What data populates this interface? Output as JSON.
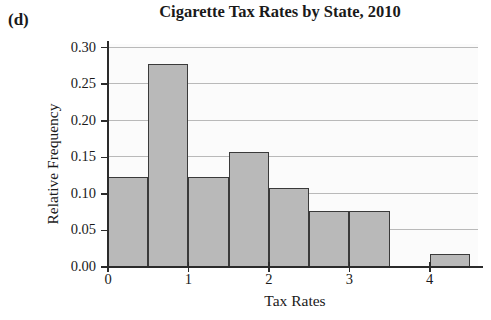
{
  "panel": {
    "label": "(d)"
  },
  "chart_data": {
    "type": "bar",
    "title": "Cigarette Tax Rates by State, 2010",
    "xlabel": "Tax Rates",
    "ylabel": "Relative Frequency",
    "subtitle": "",
    "grid": true,
    "legend": false,
    "legend_position": "none",
    "xlim": [
      0,
      4.6
    ],
    "ylim": [
      0.0,
      0.305
    ],
    "bin_width": 0.5,
    "bin_edges": [
      0.0,
      0.5,
      1.0,
      1.5,
      2.0,
      2.5,
      3.0,
      3.5,
      4.0,
      4.5
    ],
    "categories": [
      "0.0-0.5",
      "0.5-1.0",
      "1.0-1.5",
      "1.5-2.0",
      "2.0-2.5",
      "2.5-3.0",
      "3.0-3.5",
      "3.5-4.0",
      "4.0-4.5"
    ],
    "values": [
      0.123,
      0.277,
      0.123,
      0.157,
      0.108,
      0.076,
      0.076,
      0.0,
      0.018
    ],
    "bars": [
      {
        "x0": 0.0,
        "x1": 0.5,
        "value": 0.123
      },
      {
        "x0": 0.5,
        "x1": 1.0,
        "value": 0.277
      },
      {
        "x0": 1.0,
        "x1": 1.5,
        "value": 0.123
      },
      {
        "x0": 1.5,
        "x1": 2.0,
        "value": 0.157
      },
      {
        "x0": 2.0,
        "x1": 2.5,
        "value": 0.108
      },
      {
        "x0": 2.5,
        "x1": 3.0,
        "value": 0.076
      },
      {
        "x0": 3.0,
        "x1": 3.5,
        "value": 0.076
      },
      {
        "x0": 4.0,
        "x1": 4.5,
        "value": 0.018
      }
    ],
    "yticks": [
      0.0,
      0.05,
      0.1,
      0.15,
      0.2,
      0.25,
      0.3
    ],
    "ytick_labels": [
      "0.00",
      "0.05",
      "0.10",
      "0.15",
      "0.20",
      "0.25",
      "0.30"
    ],
    "xticks": [
      0,
      1,
      2,
      3,
      4
    ],
    "xtick_labels": [
      "0",
      "1",
      "2",
      "3",
      "4"
    ],
    "colors": {
      "bar_fill": "#b9b9b9",
      "bar_edge": "#3a3a3a",
      "plot_background": "#fbfbfb",
      "gridline": "#b9b9b9",
      "axis": "#2b2b2b",
      "text": "#1a1a1a"
    }
  }
}
